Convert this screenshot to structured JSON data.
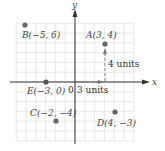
{
  "diagram": {
    "type": "coordinate-plane",
    "axes": {
      "x_label": "x",
      "y_label": "y",
      "origin_label": "0"
    },
    "grid": {
      "min": -6,
      "max": 6,
      "step": 1
    },
    "points": [
      {
        "name": "A",
        "x": 3,
        "y": 4,
        "label": "A(3, 4)"
      },
      {
        "name": "B",
        "x": -5,
        "y": 6,
        "label": "B(−5, 6)"
      },
      {
        "name": "C",
        "x": -2,
        "y": -4,
        "label": "C(−2, −4)"
      },
      {
        "name": "D",
        "x": 4,
        "y": -3,
        "label": "D(4, −3)"
      },
      {
        "name": "E",
        "x": -3,
        "y": 0,
        "label": "E(−3, 0)"
      }
    ],
    "annotations": {
      "horizontal": "3 units",
      "vertical": "4 units"
    },
    "colors": {
      "grid": "#e2e2e2",
      "axis": "#333333",
      "point": "#666666",
      "dashed": "#777777"
    }
  }
}
